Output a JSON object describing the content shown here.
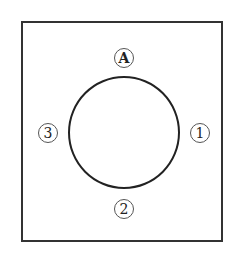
{
  "diagram": {
    "labels": {
      "top": "A",
      "right": "1",
      "bottom": "2",
      "left": "3"
    },
    "colors": {
      "stroke": "#222222",
      "background": "#ffffff"
    }
  }
}
